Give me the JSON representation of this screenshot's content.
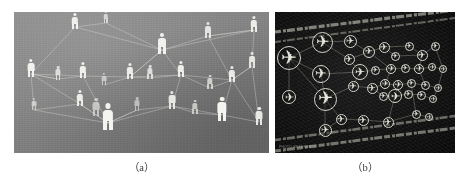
{
  "figure": {
    "panels": [
      {
        "id": "panel-a",
        "caption": "（a）",
        "subject": "social-network-of-people",
        "background_color": "#85857f",
        "node_color": "#f2f2ee",
        "edge_color": "#d8d8d4",
        "node_icon": "person-icon",
        "node_count": 24,
        "edge_count": 46
      },
      {
        "id": "panel-b",
        "caption": "（b）",
        "subject": "air-route-network-of-airports",
        "background_color": "#101010",
        "node_color": "#e6e6dc",
        "edge_color": "#b9b9ae",
        "node_icon": "airplane-icon",
        "node_count": 38,
        "edge_count": 52,
        "watermark_text": "PHOTO  REFERENCE"
      }
    ]
  },
  "panel_a_nodes": [
    {
      "x": 61,
      "y": 9,
      "s": 1.0,
      "o": 0.96
    },
    {
      "x": 92,
      "y": 5,
      "s": 0.7,
      "o": 0.7
    },
    {
      "x": 148,
      "y": 32,
      "s": 1.25,
      "o": 0.98
    },
    {
      "x": 194,
      "y": 18,
      "s": 0.95,
      "o": 0.85
    },
    {
      "x": 240,
      "y": 12,
      "s": 1.0,
      "o": 0.94
    },
    {
      "x": 17,
      "y": 56,
      "s": 1.05,
      "o": 0.98
    },
    {
      "x": 44,
      "y": 61,
      "s": 0.8,
      "o": 0.78
    },
    {
      "x": 69,
      "y": 58,
      "s": 1.0,
      "o": 0.96
    },
    {
      "x": 90,
      "y": 67,
      "s": 0.75,
      "o": 0.6
    },
    {
      "x": 116,
      "y": 59,
      "s": 0.98,
      "o": 0.93
    },
    {
      "x": 136,
      "y": 60,
      "s": 0.82,
      "o": 0.8
    },
    {
      "x": 167,
      "y": 57,
      "s": 1.0,
      "o": 0.95
    },
    {
      "x": 196,
      "y": 70,
      "s": 0.85,
      "o": 0.7
    },
    {
      "x": 218,
      "y": 62,
      "s": 1.0,
      "o": 0.92
    },
    {
      "x": 238,
      "y": 48,
      "s": 0.92,
      "o": 0.88
    },
    {
      "x": 20,
      "y": 92,
      "s": 0.75,
      "o": 0.62
    },
    {
      "x": 66,
      "y": 86,
      "s": 1.0,
      "o": 0.93
    },
    {
      "x": 82,
      "y": 95,
      "s": 1.1,
      "o": 0.6
    },
    {
      "x": 94,
      "y": 105,
      "s": 1.6,
      "o": 1.0
    },
    {
      "x": 123,
      "y": 92,
      "s": 0.8,
      "o": 0.55
    },
    {
      "x": 158,
      "y": 88,
      "s": 1.05,
      "o": 0.9
    },
    {
      "x": 181,
      "y": 95,
      "s": 0.85,
      "o": 0.66
    },
    {
      "x": 208,
      "y": 97,
      "s": 1.45,
      "o": 1.0
    },
    {
      "x": 245,
      "y": 104,
      "s": 1.1,
      "o": 0.9
    }
  ],
  "panel_a_edges": [
    [
      61,
      9,
      148,
      32
    ],
    [
      61,
      9,
      17,
      56
    ],
    [
      92,
      5,
      148,
      32
    ],
    [
      148,
      32,
      194,
      18
    ],
    [
      148,
      32,
      240,
      12
    ],
    [
      194,
      18,
      240,
      12
    ],
    [
      194,
      18,
      218,
      62
    ],
    [
      240,
      12,
      238,
      48
    ],
    [
      17,
      56,
      69,
      58
    ],
    [
      17,
      56,
      66,
      86
    ],
    [
      69,
      58,
      116,
      59
    ],
    [
      69,
      58,
      94,
      105
    ],
    [
      116,
      59,
      167,
      57
    ],
    [
      116,
      59,
      148,
      32
    ],
    [
      167,
      57,
      218,
      62
    ],
    [
      167,
      57,
      148,
      32
    ],
    [
      218,
      62,
      238,
      48
    ],
    [
      218,
      62,
      245,
      104
    ],
    [
      66,
      86,
      94,
      105
    ],
    [
      94,
      105,
      158,
      88
    ],
    [
      158,
      88,
      208,
      97
    ],
    [
      208,
      97,
      245,
      104
    ],
    [
      20,
      92,
      94,
      105
    ],
    [
      20,
      92,
      17,
      56
    ],
    [
      44,
      61,
      69,
      58
    ],
    [
      44,
      61,
      17,
      56
    ],
    [
      90,
      67,
      116,
      59
    ],
    [
      136,
      60,
      167,
      57
    ],
    [
      136,
      60,
      116,
      59
    ],
    [
      196,
      70,
      218,
      62
    ],
    [
      181,
      95,
      208,
      97
    ],
    [
      123,
      92,
      158,
      88
    ],
    [
      94,
      105,
      123,
      92
    ],
    [
      66,
      86,
      20,
      92
    ],
    [
      240,
      12,
      194,
      18
    ],
    [
      148,
      32,
      116,
      59
    ],
    [
      167,
      57,
      196,
      70
    ],
    [
      238,
      48,
      218,
      62
    ],
    [
      208,
      97,
      218,
      62
    ],
    [
      245,
      104,
      238,
      48
    ],
    [
      17,
      56,
      44,
      61
    ],
    [
      94,
      105,
      66,
      86
    ],
    [
      158,
      88,
      167,
      57
    ],
    [
      123,
      92,
      94,
      105
    ],
    [
      181,
      95,
      158,
      88
    ],
    [
      92,
      5,
      61,
      9
    ]
  ],
  "panel_b_nodes": [
    {
      "x": 14,
      "y": 36,
      "r": 12.0
    },
    {
      "x": 47,
      "y": 20,
      "r": 10.5
    },
    {
      "x": 75,
      "y": 19,
      "r": 6.5
    },
    {
      "x": 94,
      "y": 30,
      "r": 6.0
    },
    {
      "x": 74,
      "y": 37,
      "r": 5.5
    },
    {
      "x": 109,
      "y": 25,
      "r": 5.5
    },
    {
      "x": 120,
      "y": 34,
      "r": 4.5
    },
    {
      "x": 134,
      "y": 24,
      "r": 4.5
    },
    {
      "x": 147,
      "y": 33,
      "r": 5.5
    },
    {
      "x": 160,
      "y": 24,
      "r": 4.5
    },
    {
      "x": 46,
      "y": 52,
      "r": 9.0
    },
    {
      "x": 85,
      "y": 50,
      "r": 8.0
    },
    {
      "x": 100,
      "y": 48,
      "r": 4.5
    },
    {
      "x": 116,
      "y": 47,
      "r": 5.0
    },
    {
      "x": 130,
      "y": 46,
      "r": 4.5
    },
    {
      "x": 144,
      "y": 47,
      "r": 5.0
    },
    {
      "x": 157,
      "y": 45,
      "r": 4.0
    },
    {
      "x": 168,
      "y": 47,
      "r": 4.0
    },
    {
      "x": 14,
      "y": 75,
      "r": 7.0
    },
    {
      "x": 50,
      "y": 77,
      "r": 11.5
    },
    {
      "x": 78,
      "y": 64,
      "r": 5.5
    },
    {
      "x": 97,
      "y": 66,
      "r": 5.5
    },
    {
      "x": 110,
      "y": 62,
      "r": 5.0
    },
    {
      "x": 123,
      "y": 63,
      "r": 5.0
    },
    {
      "x": 136,
      "y": 61,
      "r": 4.5
    },
    {
      "x": 150,
      "y": 63,
      "r": 4.5
    },
    {
      "x": 163,
      "y": 66,
      "r": 4.0
    },
    {
      "x": 108,
      "y": 74,
      "r": 4.5
    },
    {
      "x": 120,
      "y": 74,
      "r": 7.0
    },
    {
      "x": 133,
      "y": 72,
      "r": 4.5
    },
    {
      "x": 146,
      "y": 73,
      "r": 4.5
    },
    {
      "x": 158,
      "y": 77,
      "r": 4.0
    },
    {
      "x": 66,
      "y": 97,
      "r": 5.5
    },
    {
      "x": 88,
      "y": 98,
      "r": 5.5
    },
    {
      "x": 113,
      "y": 100,
      "r": 5.5
    },
    {
      "x": 50,
      "y": 108,
      "r": 6.5
    },
    {
      "x": 141,
      "y": 92,
      "r": 4.5
    },
    {
      "x": 154,
      "y": 95,
      "r": 4.0
    }
  ],
  "panel_b_edges": [
    [
      14,
      36,
      47,
      20
    ],
    [
      14,
      36,
      46,
      52
    ],
    [
      14,
      36,
      14,
      75
    ],
    [
      14,
      36,
      50,
      77
    ],
    [
      47,
      20,
      75,
      19
    ],
    [
      75,
      19,
      94,
      30
    ],
    [
      94,
      30,
      109,
      25
    ],
    [
      109,
      25,
      120,
      34
    ],
    [
      109,
      25,
      134,
      24
    ],
    [
      134,
      24,
      147,
      33
    ],
    [
      147,
      33,
      160,
      24
    ],
    [
      120,
      34,
      147,
      33
    ],
    [
      47,
      20,
      74,
      37
    ],
    [
      74,
      37,
      85,
      50
    ],
    [
      46,
      52,
      85,
      50
    ],
    [
      46,
      52,
      50,
      77
    ],
    [
      85,
      50,
      100,
      48
    ],
    [
      100,
      48,
      116,
      47
    ],
    [
      116,
      47,
      130,
      46
    ],
    [
      130,
      46,
      144,
      47
    ],
    [
      144,
      47,
      157,
      45
    ],
    [
      157,
      45,
      168,
      47
    ],
    [
      94,
      30,
      116,
      47
    ],
    [
      147,
      33,
      144,
      47
    ],
    [
      50,
      77,
      78,
      64
    ],
    [
      78,
      64,
      97,
      66
    ],
    [
      97,
      66,
      110,
      62
    ],
    [
      110,
      62,
      123,
      63
    ],
    [
      123,
      63,
      136,
      61
    ],
    [
      136,
      61,
      150,
      63
    ],
    [
      150,
      63,
      163,
      66
    ],
    [
      120,
      74,
      108,
      74
    ],
    [
      120,
      74,
      133,
      72
    ],
    [
      133,
      72,
      146,
      73
    ],
    [
      146,
      73,
      158,
      77
    ],
    [
      97,
      66,
      108,
      74
    ],
    [
      123,
      63,
      120,
      74
    ],
    [
      50,
      77,
      66,
      97
    ],
    [
      66,
      97,
      88,
      98
    ],
    [
      88,
      98,
      113,
      100
    ],
    [
      50,
      77,
      50,
      108
    ],
    [
      50,
      108,
      66,
      97
    ],
    [
      113,
      100,
      141,
      92
    ],
    [
      141,
      92,
      154,
      95
    ],
    [
      120,
      74,
      113,
      100
    ],
    [
      85,
      50,
      78,
      64
    ],
    [
      116,
      47,
      110,
      62
    ],
    [
      144,
      47,
      150,
      63
    ],
    [
      168,
      47,
      163,
      66
    ],
    [
      158,
      77,
      163,
      66
    ],
    [
      136,
      61,
      141,
      92
    ],
    [
      160,
      24,
      168,
      47
    ],
    [
      74,
      37,
      94,
      30
    ]
  ],
  "panel_b_streaks": [
    {
      "x1": 0,
      "y1": 20,
      "x2": 180,
      "y2": -2,
      "w": 3.2,
      "o": 0.55
    },
    {
      "x1": 0,
      "y1": 30,
      "x2": 180,
      "y2": 6,
      "w": 2.0,
      "o": 0.4
    },
    {
      "x1": 0,
      "y1": 128,
      "x2": 180,
      "y2": 104,
      "w": 2.6,
      "o": 0.45
    },
    {
      "x1": 0,
      "y1": 139,
      "x2": 180,
      "y2": 116,
      "w": 3.0,
      "o": 0.5
    }
  ]
}
